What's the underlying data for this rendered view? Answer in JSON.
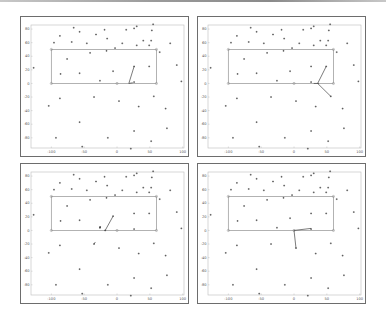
{
  "figure": {
    "layout": "2x2 grid of scatter plots",
    "panels": [
      "top-left",
      "top-right",
      "bottom-left",
      "bottom-right"
    ]
  },
  "chart_data": [
    {
      "type": "scatter",
      "title": "",
      "xlabel": "",
      "ylabel": "",
      "xlim": [
        -131,
        102
      ],
      "ylim": [
        -95,
        86
      ],
      "xticks": [
        -100,
        -50,
        0,
        50,
        100
      ],
      "yticks": [
        80,
        60,
        40,
        20,
        0,
        -20,
        -40,
        -60,
        -80
      ],
      "grid": false,
      "rectangle": {
        "x0": -100,
        "y0": 0,
        "x1": 60,
        "y1": 50,
        "color": "#999999"
      },
      "rectangle_markers": [
        [
          -100,
          50
        ],
        [
          60,
          50
        ],
        [
          -100,
          0
        ],
        [
          0,
          0
        ],
        [
          60,
          0
        ]
      ],
      "points": [
        [
          -66,
          82
        ],
        [
          -57,
          76
        ],
        [
          -87,
          70
        ],
        [
          -96,
          60
        ],
        [
          -69,
          61
        ],
        [
          -46,
          59
        ],
        [
          -32,
          72
        ],
        [
          -19,
          79
        ],
        [
          -15,
          66
        ],
        [
          14,
          79
        ],
        [
          26,
          81
        ],
        [
          30,
          84
        ],
        [
          55,
          87
        ],
        [
          53,
          78
        ],
        [
          8,
          59
        ],
        [
          -3,
          52
        ],
        [
          30,
          56
        ],
        [
          40,
          63
        ],
        [
          49,
          56
        ],
        [
          52,
          63
        ],
        [
          81,
          59
        ],
        [
          65,
          46
        ],
        [
          -16,
          48
        ],
        [
          -41,
          45
        ],
        [
          -76,
          36
        ],
        [
          -127,
          23
        ],
        [
          -86,
          14
        ],
        [
          -57,
          15
        ],
        [
          -6,
          18
        ],
        [
          26,
          25
        ],
        [
          49,
          25
        ],
        [
          91,
          27
        ],
        [
          98,
          3
        ],
        [
          -26,
          4
        ],
        [
          26,
          2
        ],
        [
          -104,
          -33
        ],
        [
          -87,
          -22
        ],
        [
          -35,
          -20
        ],
        [
          3,
          -26
        ],
        [
          33,
          -34
        ],
        [
          56,
          -19
        ],
        [
          74,
          -37
        ],
        [
          -57,
          -57
        ],
        [
          26,
          -70
        ],
        [
          76,
          -66
        ],
        [
          -93,
          -80
        ],
        [
          -14,
          -80
        ],
        [
          52,
          -85
        ],
        [
          -53,
          -93
        ],
        [
          21,
          -96
        ]
      ],
      "segments": [
        [
          [
            18,
            0
          ],
          [
            26,
            25
          ]
        ],
        [
          [
            18,
            0
          ],
          [
            24,
            1
          ]
        ]
      ]
    },
    {
      "type": "scatter",
      "title": "",
      "xlabel": "",
      "ylabel": "",
      "xlim": [
        -131,
        102
      ],
      "ylim": [
        -95,
        86
      ],
      "xticks": [
        -100,
        -50,
        0,
        50,
        100
      ],
      "yticks": [
        80,
        60,
        40,
        20,
        0,
        -20,
        -40,
        -60,
        -80
      ],
      "grid": false,
      "rectangle": {
        "x0": -100,
        "y0": 0,
        "x1": 60,
        "y1": 50,
        "color": "#999999"
      },
      "rectangle_markers": [
        [
          -100,
          50
        ],
        [
          60,
          50
        ],
        [
          -100,
          0
        ],
        [
          0,
          0
        ],
        [
          60,
          0
        ]
      ],
      "points": [
        [
          -66,
          82
        ],
        [
          -57,
          76
        ],
        [
          -87,
          70
        ],
        [
          -96,
          60
        ],
        [
          -69,
          61
        ],
        [
          -46,
          59
        ],
        [
          -32,
          72
        ],
        [
          -19,
          79
        ],
        [
          -15,
          66
        ],
        [
          14,
          79
        ],
        [
          26,
          81
        ],
        [
          30,
          84
        ],
        [
          55,
          87
        ],
        [
          53,
          78
        ],
        [
          8,
          59
        ],
        [
          -3,
          52
        ],
        [
          30,
          56
        ],
        [
          40,
          63
        ],
        [
          49,
          56
        ],
        [
          52,
          63
        ],
        [
          81,
          59
        ],
        [
          65,
          46
        ],
        [
          -16,
          48
        ],
        [
          -41,
          45
        ],
        [
          -76,
          36
        ],
        [
          -127,
          23
        ],
        [
          -86,
          14
        ],
        [
          -57,
          15
        ],
        [
          -6,
          18
        ],
        [
          26,
          25
        ],
        [
          49,
          25
        ],
        [
          91,
          27
        ],
        [
          98,
          3
        ],
        [
          -26,
          4
        ],
        [
          26,
          2
        ],
        [
          -104,
          -33
        ],
        [
          -87,
          -22
        ],
        [
          -35,
          -20
        ],
        [
          3,
          -26
        ],
        [
          33,
          -34
        ],
        [
          56,
          -19
        ],
        [
          74,
          -37
        ],
        [
          -57,
          -57
        ],
        [
          26,
          -70
        ],
        [
          76,
          -66
        ],
        [
          -93,
          -80
        ],
        [
          -14,
          -80
        ],
        [
          52,
          -85
        ],
        [
          -53,
          -93
        ],
        [
          21,
          -96
        ]
      ],
      "segments": [
        [
          [
            36,
            0
          ],
          [
            49,
            25
          ]
        ],
        [
          [
            36,
            0
          ],
          [
            56,
            -19
          ]
        ],
        [
          [
            30,
            0
          ],
          [
            38,
            0
          ]
        ]
      ]
    },
    {
      "type": "scatter",
      "title": "",
      "xlabel": "",
      "ylabel": "",
      "xlim": [
        -131,
        102
      ],
      "ylim": [
        -95,
        86
      ],
      "xticks": [
        -100,
        -50,
        0,
        50,
        100
      ],
      "yticks": [
        80,
        60,
        40,
        20,
        0,
        -20,
        -40,
        -60,
        -80
      ],
      "grid": false,
      "rectangle": {
        "x0": -100,
        "y0": 0,
        "x1": 60,
        "y1": 50,
        "color": "#999999"
      },
      "rectangle_markers": [
        [
          -100,
          50
        ],
        [
          60,
          50
        ],
        [
          -100,
          0
        ],
        [
          0,
          0
        ],
        [
          60,
          0
        ]
      ],
      "points": [
        [
          -66,
          82
        ],
        [
          -57,
          76
        ],
        [
          -87,
          70
        ],
        [
          -96,
          60
        ],
        [
          -69,
          61
        ],
        [
          -46,
          59
        ],
        [
          -32,
          72
        ],
        [
          -19,
          79
        ],
        [
          -15,
          66
        ],
        [
          14,
          79
        ],
        [
          26,
          81
        ],
        [
          30,
          84
        ],
        [
          55,
          87
        ],
        [
          53,
          78
        ],
        [
          8,
          59
        ],
        [
          -3,
          52
        ],
        [
          30,
          56
        ],
        [
          40,
          63
        ],
        [
          49,
          56
        ],
        [
          52,
          63
        ],
        [
          81,
          59
        ],
        [
          65,
          46
        ],
        [
          -16,
          48
        ],
        [
          -41,
          45
        ],
        [
          -76,
          36
        ],
        [
          -127,
          23
        ],
        [
          -86,
          14
        ],
        [
          -57,
          15
        ],
        [
          -6,
          21
        ],
        [
          26,
          25
        ],
        [
          49,
          25
        ],
        [
          91,
          27
        ],
        [
          98,
          3
        ],
        [
          -26,
          4
        ],
        [
          26,
          2
        ],
        [
          -104,
          -33
        ],
        [
          -87,
          -22
        ],
        [
          -35,
          -20
        ],
        [
          3,
          -26
        ],
        [
          33,
          -34
        ],
        [
          56,
          -19
        ],
        [
          74,
          -37
        ],
        [
          -57,
          -57
        ],
        [
          26,
          -70
        ],
        [
          76,
          -66
        ],
        [
          -93,
          -80
        ],
        [
          -14,
          -80
        ],
        [
          52,
          -85
        ],
        [
          -53,
          -93
        ],
        [
          21,
          -96
        ],
        [
          -18,
          0
        ],
        [
          -26,
          5
        ]
      ],
      "segments": [
        [
          [
            -18,
            0
          ],
          [
            -6,
            21
          ]
        ],
        [
          [
            -35,
            -20
          ],
          [
            -33,
            -17
          ]
        ],
        [
          [
            -26,
            3
          ],
          [
            -25,
            6
          ]
        ]
      ]
    },
    {
      "type": "scatter",
      "title": "",
      "xlabel": "",
      "ylabel": "",
      "xlim": [
        -131,
        102
      ],
      "ylim": [
        -95,
        86
      ],
      "xticks": [
        -100,
        -50,
        0,
        50,
        100
      ],
      "yticks": [
        80,
        60,
        40,
        20,
        0,
        -20,
        -40,
        -60,
        -80
      ],
      "grid": false,
      "rectangle": {
        "x0": -100,
        "y0": 0,
        "x1": 60,
        "y1": 50,
        "color": "#999999"
      },
      "rectangle_markers": [
        [
          -100,
          50
        ],
        [
          60,
          50
        ],
        [
          -100,
          0
        ],
        [
          0,
          0
        ],
        [
          60,
          0
        ]
      ],
      "points": [
        [
          -66,
          82
        ],
        [
          -57,
          76
        ],
        [
          -87,
          70
        ],
        [
          -96,
          60
        ],
        [
          -69,
          61
        ],
        [
          -46,
          59
        ],
        [
          -32,
          72
        ],
        [
          -19,
          79
        ],
        [
          -15,
          66
        ],
        [
          14,
          79
        ],
        [
          26,
          81
        ],
        [
          30,
          84
        ],
        [
          55,
          87
        ],
        [
          53,
          78
        ],
        [
          8,
          59
        ],
        [
          -3,
          52
        ],
        [
          30,
          56
        ],
        [
          40,
          63
        ],
        [
          49,
          56
        ],
        [
          52,
          63
        ],
        [
          81,
          59
        ],
        [
          65,
          46
        ],
        [
          -16,
          48
        ],
        [
          -41,
          45
        ],
        [
          -76,
          36
        ],
        [
          -127,
          23
        ],
        [
          -86,
          14
        ],
        [
          -57,
          15
        ],
        [
          -6,
          18
        ],
        [
          26,
          25
        ],
        [
          49,
          25
        ],
        [
          91,
          27
        ],
        [
          98,
          3
        ],
        [
          -26,
          4
        ],
        [
          26,
          2
        ],
        [
          -104,
          -33
        ],
        [
          -87,
          -22
        ],
        [
          -35,
          -20
        ],
        [
          3,
          -26
        ],
        [
          33,
          -34
        ],
        [
          56,
          -19
        ],
        [
          74,
          -37
        ],
        [
          -57,
          -57
        ],
        [
          26,
          -70
        ],
        [
          76,
          -66
        ],
        [
          -93,
          -80
        ],
        [
          -14,
          -80
        ],
        [
          52,
          -85
        ],
        [
          -53,
          -93
        ],
        [
          21,
          -96
        ]
      ],
      "segments": [
        [
          [
            0,
            0
          ],
          [
            26,
            3
          ]
        ],
        [
          [
            0,
            0
          ],
          [
            3,
            -26
          ]
        ]
      ]
    }
  ],
  "colors": {
    "frame": "#6d6d6d",
    "axes": "#bdbdbd",
    "rectangle": "#a0a0a0",
    "point": "#333333",
    "segment": "#444444"
  }
}
